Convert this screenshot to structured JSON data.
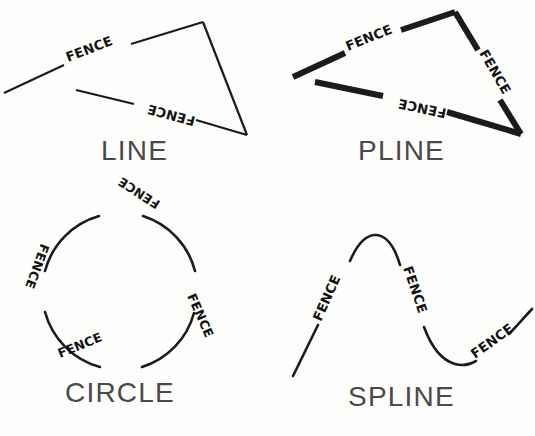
{
  "page": {
    "background_color": "#fdfdfc",
    "ink_color": "#1b1b1b",
    "caption_color": "#4a4a4a",
    "width": 535,
    "height": 436
  },
  "figures": [
    {
      "id": "line",
      "caption": "LINE",
      "entity_type": "line",
      "stroke_width": 2.2,
      "labels": [
        "FENCE",
        "FENCE"
      ],
      "segments": [
        {
          "name": "upper-left-line",
          "label": "FENCE",
          "label_flipped": false
        },
        {
          "name": "lower-line",
          "label": "FENCE",
          "label_flipped": true
        },
        {
          "name": "right-line",
          "label": null,
          "label_flipped": false
        }
      ]
    },
    {
      "id": "pline",
      "caption": "PLINE",
      "entity_type": "polyline",
      "stroke_width": 6.0,
      "labels": [
        "FENCE",
        "FENCE",
        "FENCE"
      ],
      "segments": [
        {
          "name": "upper-left-segment",
          "label": "FENCE",
          "label_flipped": false
        },
        {
          "name": "right-segment",
          "label": "FENCE",
          "label_flipped": false
        },
        {
          "name": "bottom-segment",
          "label": "FENCE",
          "label_flipped": true
        }
      ]
    },
    {
      "id": "circle",
      "caption": "CIRCLE",
      "entity_type": "circle",
      "stroke_width": 2.6,
      "labels": [
        "FENCE",
        "FENCE",
        "FENCE",
        "FENCE"
      ],
      "arcs": [
        {
          "name": "arc-top-right",
          "label": "FENCE",
          "label_flipped": true
        },
        {
          "name": "arc-bottom-right",
          "label": "FENCE",
          "label_flipped": false
        },
        {
          "name": "arc-bottom-left",
          "label": "FENCE",
          "label_flipped": false
        },
        {
          "name": "arc-top-left",
          "label": "FENCE",
          "label_flipped": true
        }
      ]
    },
    {
      "id": "spline",
      "caption": "SPLINE",
      "entity_type": "spline",
      "stroke_width": 2.6,
      "labels": [
        "FENCE",
        "FENCE",
        "FENCE"
      ],
      "segments": [
        {
          "name": "rising-segment",
          "label": "FENCE",
          "label_flipped": false
        },
        {
          "name": "falling-segment",
          "label": "FENCE",
          "label_flipped": false
        },
        {
          "name": "trailing-rise-segment",
          "label": "FENCE",
          "label_flipped": false
        }
      ]
    }
  ],
  "captions": {
    "line": "LINE",
    "pline": "PLINE",
    "circle": "CIRCLE",
    "spline": "SPLINE"
  },
  "label_text": {
    "fence": "FENCE"
  }
}
